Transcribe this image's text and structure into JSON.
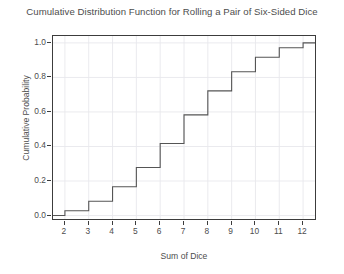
{
  "chart_data": {
    "type": "line",
    "title": "Cumulative Distribution Function for Rolling a Pair of Six-Sided Dice",
    "xlabel": "Sum of Dice",
    "ylabel": "Cumulative Probability",
    "step_style": "step-post",
    "x": [
      2,
      3,
      4,
      5,
      6,
      7,
      8,
      9,
      10,
      11,
      12
    ],
    "values": [
      0.028,
      0.083,
      0.167,
      0.278,
      0.417,
      0.583,
      0.722,
      0.833,
      0.917,
      0.972,
      1.0
    ],
    "fractions": [
      "1/36",
      "3/36",
      "6/36",
      "10/36",
      "15/36",
      "21/36",
      "26/36",
      "30/36",
      "33/36",
      "35/36",
      "36/36"
    ],
    "xlim": [
      1.5,
      12.5
    ],
    "ylim": [
      -0.02,
      1.04
    ],
    "xticks": [
      2,
      3,
      4,
      5,
      6,
      7,
      8,
      9,
      10,
      11,
      12
    ],
    "xticklabels": [
      "2",
      "3",
      "4",
      "5",
      "6",
      "7",
      "8",
      "9",
      "10",
      "11",
      "12"
    ],
    "yticks": [
      0.0,
      0.2,
      0.4,
      0.6,
      0.8,
      1.0
    ],
    "yticklabels": [
      "0.0",
      "0.2",
      "0.4",
      "0.6",
      "0.8",
      "1.0"
    ],
    "grid": true,
    "legend": false,
    "line_color": "#555555",
    "grid_color": "#e8e8ec",
    "border_color": "#3c3c3c",
    "background_color": "#ffffff",
    "text_color": "#4d4d4d"
  }
}
